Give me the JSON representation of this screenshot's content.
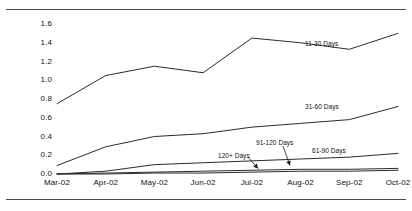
{
  "chart_data": {
    "type": "line",
    "title": "",
    "subtitle": "",
    "xlabel": "",
    "ylabel": "",
    "grid": false,
    "legend_position": "inline-annotations",
    "x": [
      "Mar-02",
      "Apr-02",
      "May-02",
      "Jun-02",
      "Jul-02",
      "Aug-02",
      "Sep-02",
      "Oct-02"
    ],
    "categories": [
      "Mar-02",
      "Apr-02",
      "May-02",
      "Jun-02",
      "Jul-02",
      "Aug-02",
      "Sep-02",
      "Oct-02"
    ],
    "ylim": [
      0.0,
      1.6
    ],
    "yticks": [
      0.0,
      0.2,
      0.4,
      0.6,
      0.8,
      1.0,
      1.2,
      1.4,
      1.6
    ],
    "ytick_labels": [
      "0.0",
      "0.2",
      "0.4",
      "0.6",
      "0.8",
      "1.0",
      "1.2",
      "1.4",
      "1.6"
    ],
    "series": [
      {
        "name": "11-30 Days",
        "values": [
          0.75,
          1.05,
          1.15,
          1.08,
          1.45,
          1.4,
          1.33,
          1.5
        ],
        "color": "#2b2b2b"
      },
      {
        "name": "31-60 Days",
        "values": [
          0.09,
          0.29,
          0.4,
          0.43,
          0.5,
          0.54,
          0.58,
          0.72
        ],
        "color": "#2b2b2b"
      },
      {
        "name": "61-90 Days",
        "values": [
          0.0,
          0.03,
          0.1,
          0.12,
          0.14,
          0.16,
          0.18,
          0.22
        ],
        "color": "#2b2b2b"
      },
      {
        "name": "91-120 Days",
        "values": [
          0.0,
          0.01,
          0.02,
          0.03,
          0.04,
          0.05,
          0.05,
          0.06
        ],
        "color": "#2b2b2b"
      },
      {
        "name": "120+ Days",
        "values": [
          0.0,
          0.0,
          0.01,
          0.01,
          0.02,
          0.03,
          0.03,
          0.04
        ],
        "color": "#2b2b2b"
      }
    ],
    "annotations": [
      {
        "text": "11-30 Days",
        "x": 305,
        "y": 40,
        "arrow": false
      },
      {
        "text": "31-60 Days",
        "x": 305,
        "y": 103,
        "arrow": false
      },
      {
        "text": "61-90 Days",
        "x": 312,
        "y": 147,
        "arrow": false
      },
      {
        "text": "91-120 Days",
        "x": 256,
        "y": 139,
        "arrow": true
      },
      {
        "text": "120+ Days",
        "x": 218,
        "y": 152,
        "arrow": true
      }
    ]
  }
}
